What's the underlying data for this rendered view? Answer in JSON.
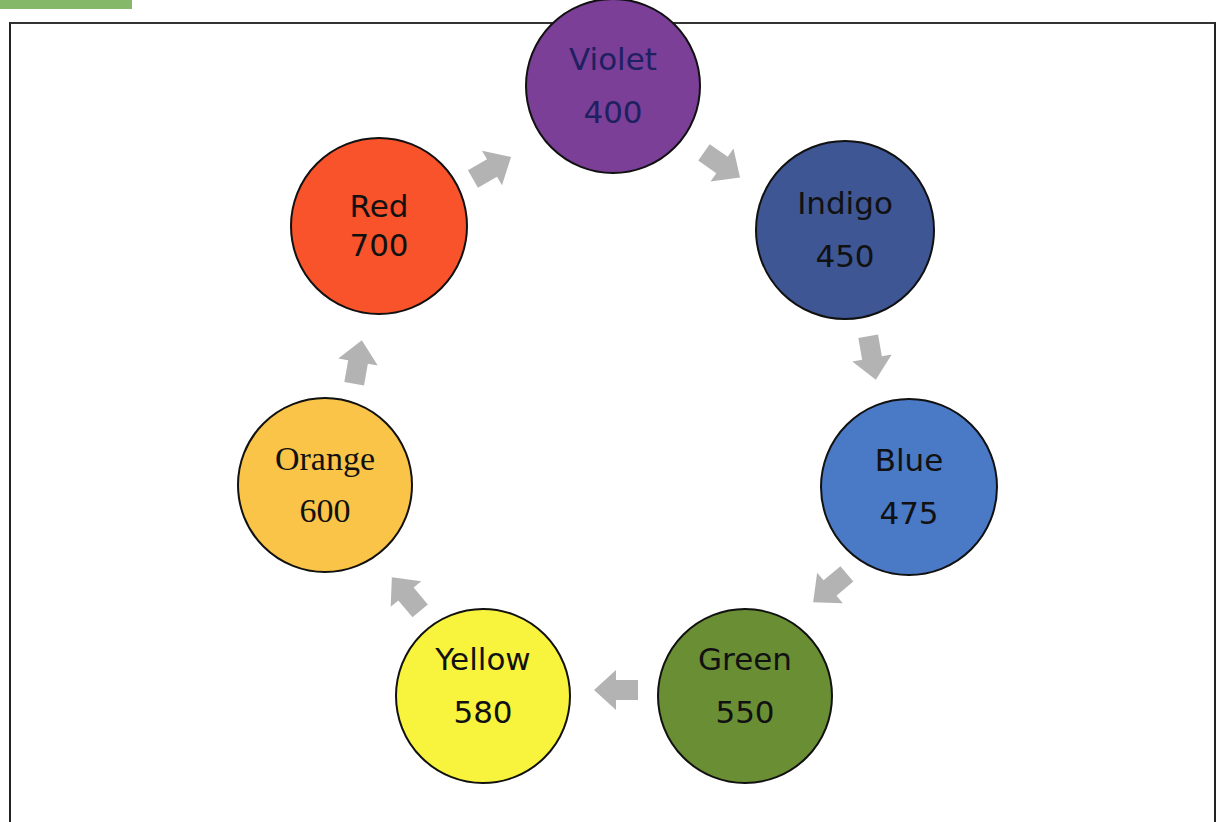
{
  "figure": {
    "label_bar_color": "#86b86a",
    "caption": "",
    "frame_color": "#222222"
  },
  "cycle": {
    "arrow_color": "#b3b3b3",
    "nodes": [
      {
        "name": "Violet",
        "value": "400",
        "color": "#7b3f98",
        "text_color": "#1e2060"
      },
      {
        "name": "Indigo",
        "value": "450",
        "color": "#3e5694",
        "text_color": "#111111"
      },
      {
        "name": "Blue",
        "value": "475",
        "color": "#4a79c6",
        "text_color": "#111111"
      },
      {
        "name": "Green",
        "value": "550",
        "color": "#6a8e34",
        "text_color": "#111111"
      },
      {
        "name": "Yellow",
        "value": "580",
        "color": "#f8f33c",
        "text_color": "#111111"
      },
      {
        "name": "Orange",
        "value": "600",
        "color": "#f9c447",
        "text_color": "#111111"
      },
      {
        "name": "Red",
        "value": "700",
        "color": "#f8532b",
        "text_color": "#111111"
      }
    ]
  }
}
